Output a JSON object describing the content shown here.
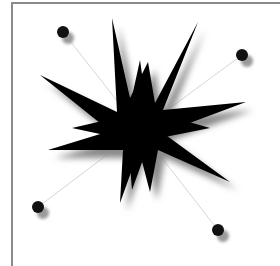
{
  "canvas": {
    "width": 280,
    "height": 266,
    "background": "#ffffff",
    "frame_color": "#8a8a8a"
  },
  "graphic": {
    "subject": "black starburst with four tethered dots",
    "star": {
      "center": [
        140,
        130
      ],
      "color": "#000000",
      "shadow": "#9a9a9a"
    },
    "satellites": [
      {
        "name": "top-left-dot",
        "x": 63,
        "y": 32
      },
      {
        "name": "top-right-dot",
        "x": 242,
        "y": 55
      },
      {
        "name": "bottom-left-dot",
        "x": 38,
        "y": 207
      },
      {
        "name": "bottom-right-dot",
        "x": 218,
        "y": 230
      }
    ]
  }
}
